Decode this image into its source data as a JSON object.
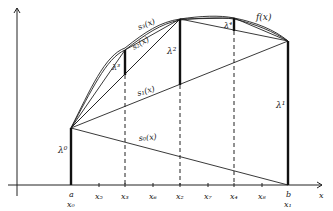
{
  "diagram": {
    "axes": {
      "x_label": "x"
    },
    "ticks": [
      {
        "label": "a",
        "sub": "x₀",
        "x": 71
      },
      {
        "label": "x₅",
        "x": 99
      },
      {
        "label": "x₃",
        "x": 125
      },
      {
        "label": "x₆",
        "x": 153
      },
      {
        "label": "x₂",
        "x": 180
      },
      {
        "label": "x₇",
        "x": 208
      },
      {
        "label": "x₄",
        "x": 234
      },
      {
        "label": "x₈",
        "x": 262
      },
      {
        "label": "b",
        "sub": "x₁",
        "x": 288
      }
    ],
    "curve_label": "f(x)",
    "approximations": {
      "s0": "s₀(x)",
      "s1": "s₁(x)",
      "s2": "s₂(x)",
      "s3": "s₃(x)"
    },
    "lambdas": {
      "l0": "λ⁰",
      "l1": "λ¹",
      "l2": "λ²",
      "l3": "λ³",
      "l4": "λ⁴"
    }
  }
}
